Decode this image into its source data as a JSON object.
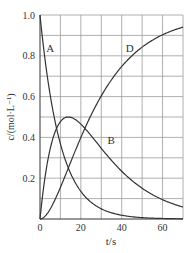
{
  "chart_data": {
    "type": "line",
    "title": "",
    "xlabel": "t/s",
    "ylabel": "c/(mol·L⁻¹)",
    "xlim": [
      0,
      70
    ],
    "ylim": [
      0,
      1.0
    ],
    "grid": true,
    "x_ticks": [
      0,
      20,
      40,
      60
    ],
    "x_tick_labels": [
      "0",
      "20",
      "40",
      "60"
    ],
    "y_ticks": [
      0.2,
      0.4,
      0.6,
      0.8,
      1.0
    ],
    "y_tick_labels": [
      "0.2",
      "0.4",
      "0.6",
      "0.8",
      "1.0"
    ],
    "x": [
      0,
      5,
      10,
      15,
      20,
      25,
      30,
      40,
      50,
      60,
      70
    ],
    "series": [
      {
        "name": "A",
        "values": [
          1.0,
          0.61,
          0.37,
          0.22,
          0.14,
          0.08,
          0.05,
          0.02,
          0.01,
          0.0,
          0.0
        ]
      },
      {
        "name": "B",
        "values": [
          0.0,
          0.35,
          0.47,
          0.5,
          0.47,
          0.43,
          0.38,
          0.28,
          0.2,
          0.13,
          0.06
        ]
      },
      {
        "name": "D",
        "values": [
          0.0,
          0.04,
          0.16,
          0.28,
          0.39,
          0.49,
          0.57,
          0.7,
          0.79,
          0.87,
          0.94
        ]
      }
    ],
    "annotations": [
      {
        "text": "A",
        "x": 3,
        "y": 0.82
      },
      {
        "text": "B",
        "x": 33,
        "y": 0.37
      },
      {
        "text": "D",
        "x": 42,
        "y": 0.82
      }
    ]
  }
}
